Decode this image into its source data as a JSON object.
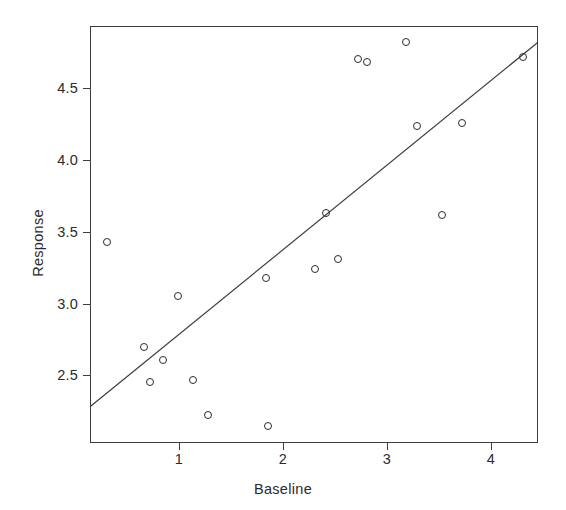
{
  "chart_data": {
    "type": "scatter",
    "title": "",
    "xlabel": "Baseline",
    "ylabel": "Response",
    "xlim": [
      0.144,
      4.454
    ],
    "ylim": [
      2.028,
      4.933
    ],
    "xticks": [
      1,
      2,
      3,
      4
    ],
    "xticklabels": [
      "1",
      "2",
      "3",
      "4"
    ],
    "yticks": [
      2.5,
      3.0,
      3.5,
      4.0,
      4.5
    ],
    "yticklabels": [
      "2.5",
      "3.0",
      "3.5",
      "4.0",
      "4.5"
    ],
    "grid": false,
    "legend": null,
    "marker": "open-circle",
    "point_color": "#2b2b2b",
    "line_color": "#3d3d3d",
    "axis_color": "#3d3d3d",
    "background": "#ffffff",
    "points": [
      {
        "x": 0.31,
        "y": 3.43
      },
      {
        "x": 0.66,
        "y": 2.7
      },
      {
        "x": 0.72,
        "y": 2.45
      },
      {
        "x": 0.85,
        "y": 2.61
      },
      {
        "x": 0.99,
        "y": 3.05
      },
      {
        "x": 1.13,
        "y": 2.47
      },
      {
        "x": 1.28,
        "y": 2.22
      },
      {
        "x": 1.84,
        "y": 3.18
      },
      {
        "x": 1.86,
        "y": 2.15
      },
      {
        "x": 2.31,
        "y": 3.24
      },
      {
        "x": 2.41,
        "y": 3.63
      },
      {
        "x": 2.53,
        "y": 3.31
      },
      {
        "x": 2.72,
        "y": 4.7
      },
      {
        "x": 2.81,
        "y": 4.68
      },
      {
        "x": 3.18,
        "y": 4.82
      },
      {
        "x": 3.29,
        "y": 4.24
      },
      {
        "x": 3.53,
        "y": 3.62
      },
      {
        "x": 3.72,
        "y": 4.26
      },
      {
        "x": 4.31,
        "y": 4.72
      }
    ],
    "fit_line": {
      "type": "linear-regression",
      "x_start": 0.144,
      "y_start": 2.28,
      "x_end": 4.454,
      "y_end": 4.82,
      "slope": 0.589,
      "intercept": 2.195
    }
  }
}
